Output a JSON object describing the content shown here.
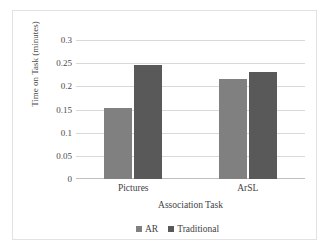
{
  "chart_data": {
    "type": "bar",
    "title": "",
    "subtitle": "",
    "xlabel": "Association Task",
    "ylabel": "Time on Task (minutes)",
    "categories": [
      "Pictures",
      "ArSL"
    ],
    "series": [
      {
        "name": "AR",
        "values": [
          0.153,
          0.215
        ],
        "color": "#808080"
      },
      {
        "name": "Traditional",
        "values": [
          0.245,
          0.23
        ],
        "color": "#595959"
      }
    ],
    "ylim": [
      0,
      0.3
    ],
    "ytick_labels": [
      "0.3",
      "0.25",
      "0.2",
      "0.15",
      "0.1",
      "0.05",
      "0"
    ],
    "ytick_values": [
      0.3,
      0.25,
      0.2,
      0.15,
      0.1,
      0.05,
      0
    ],
    "grid": true,
    "legend_position": "bottom",
    "gridline_color": "#d9d9d9",
    "axis_color": "#bfbfbf",
    "text_color": "#3f3f3f",
    "plot_background": "#ffffff",
    "frame_border_color": "#e2e2e2"
  },
  "yticks": [
    {
      "label": "0.3"
    },
    {
      "label": "0.25"
    },
    {
      "label": "0.2"
    },
    {
      "label": "0.15"
    },
    {
      "label": "0.1"
    },
    {
      "label": "0.05"
    },
    {
      "label": "0"
    }
  ],
  "xticks": [
    {
      "label": "Pictures"
    },
    {
      "label": "ArSL"
    }
  ],
  "legend": {
    "entries": [
      {
        "label": "AR",
        "marker": "square-marker-icon"
      },
      {
        "label": "Traditional",
        "marker": "square-marker-icon"
      }
    ]
  },
  "axes": {
    "x_title": "Association Task",
    "y_title": "Time on Task (minutes)"
  }
}
